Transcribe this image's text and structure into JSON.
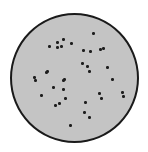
{
  "figure": {
    "description": "Circular plate / field of view with scattered dark colonies",
    "dish": {
      "center": [
        74,
        77
      ],
      "radius": 64,
      "fill_color": "#c4c4c4",
      "border_color": "#1a1a1a"
    },
    "dot_color": "#1e1e1e",
    "dot_count": 36,
    "dots": [
      [
        93,
        33
      ],
      [
        63,
        39
      ],
      [
        57,
        42
      ],
      [
        49,
        46
      ],
      [
        57,
        47
      ],
      [
        61,
        46
      ],
      [
        71,
        43
      ],
      [
        83,
        50
      ],
      [
        90,
        51
      ],
      [
        100,
        49
      ],
      [
        103,
        48
      ],
      [
        82,
        63
      ],
      [
        87,
        66
      ],
      [
        89,
        71
      ],
      [
        107,
        67
      ],
      [
        47,
        71
      ],
      [
        34,
        77
      ],
      [
        35,
        80
      ],
      [
        63,
        80
      ],
      [
        53,
        87
      ],
      [
        63,
        89
      ],
      [
        112,
        79
      ],
      [
        41,
        95
      ],
      [
        65,
        98
      ],
      [
        99,
        93
      ],
      [
        101,
        98
      ],
      [
        122,
        92
      ],
      [
        123,
        96
      ],
      [
        59,
        103
      ],
      [
        55,
        105
      ],
      [
        85,
        102
      ],
      [
        84,
        112
      ],
      [
        89,
        117
      ],
      [
        70,
        125
      ],
      [
        46,
        72
      ],
      [
        64,
        79
      ]
    ]
  }
}
